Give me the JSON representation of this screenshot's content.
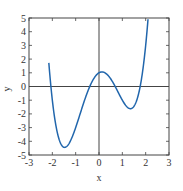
{
  "chart_data": {
    "type": "line",
    "title": "",
    "xlabel": "x",
    "ylabel": "y",
    "xlim": [
      -3,
      3
    ],
    "ylim": [
      -5,
      5
    ],
    "xticks": [
      -3,
      -2,
      -1,
      0,
      1,
      2,
      3
    ],
    "yticks": [
      -5,
      -4,
      -3,
      -2,
      -1,
      0,
      1,
      2,
      3,
      4,
      5
    ],
    "grid": false,
    "zero_lines": true,
    "legend": null,
    "series": [
      {
        "name": "f(x) = x^4 - 4x^2 + x + 1",
        "color": "#2166ac",
        "x": [
          -2.15,
          -2.0,
          -1.75,
          -1.5,
          -1.25,
          -1.0,
          -0.75,
          -0.5,
          -0.25,
          0.0,
          0.125,
          0.25,
          0.5,
          0.75,
          1.0,
          1.25,
          1.3,
          1.5,
          1.75,
          2.0,
          2.1
        ],
        "values": [
          5.0,
          3.0,
          -1.63,
          -4.44,
          -3.05,
          -3.0,
          -1.68,
          -0.44,
          0.51,
          1.0,
          1.06,
          1.0,
          0.56,
          -0.18,
          -1.0,
          -1.55,
          -1.6,
          -1.44,
          0.0,
          3.0,
          4.55
        ]
      }
    ],
    "key_points": {
      "local_min_left": {
        "x": -1.5,
        "y": -4.4
      },
      "local_max": {
        "x": 0.1,
        "y": 1.1
      },
      "local_min_right": {
        "x": 1.3,
        "y": -1.5
      }
    }
  }
}
